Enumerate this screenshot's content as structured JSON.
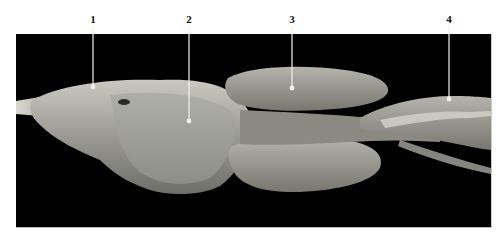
{
  "figure": {
    "background_color": "#000000",
    "page_color": "#ffffff",
    "labels": [
      {
        "number": "1",
        "x": 93,
        "target_y": 87
      },
      {
        "number": "2",
        "x": 189,
        "target_y": 121
      },
      {
        "number": "3",
        "x": 292,
        "target_y": 88
      },
      {
        "number": "4",
        "x": 449,
        "target_y": 99
      }
    ]
  }
}
